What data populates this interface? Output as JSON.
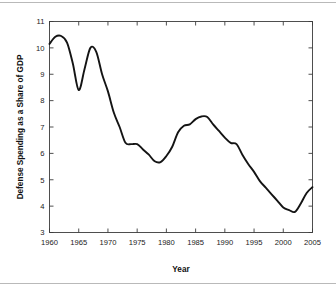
{
  "figure": {
    "background_color": "#ffffff",
    "border_color": "#b9b9b9",
    "line_color": "#141414",
    "axis_color": "#3c3c3c"
  },
  "chart_data": {
    "type": "line",
    "title": "",
    "xlabel": "Year",
    "ylabel": "Defense Spending as a Share of GDP",
    "xlim": [
      1960,
      2005
    ],
    "ylim": [
      3,
      11
    ],
    "xticks": [
      1960,
      1965,
      1970,
      1975,
      1980,
      1985,
      1990,
      1995,
      2000,
      2005
    ],
    "xticklabels": [
      "1960",
      "1965",
      "1970",
      "1975",
      "1980",
      "1985",
      "1990",
      "1995",
      "2000",
      "2005"
    ],
    "yticks": [
      3,
      4,
      5,
      6,
      7,
      8,
      9,
      10,
      11
    ],
    "yticklabels": [
      "3",
      "4",
      "5",
      "6",
      "7",
      "8",
      "9",
      "10",
      "11"
    ],
    "grid": false,
    "legend": null,
    "ticks_all_sides": true,
    "series": [
      {
        "name": "Defense Spending as a Share of GDP",
        "color": "#141414",
        "x": [
          1960,
          1961,
          1962,
          1963,
          1964,
          1965,
          1966,
          1967,
          1968,
          1969,
          1970,
          1971,
          1972,
          1973,
          1974,
          1975,
          1976,
          1977,
          1978,
          1979,
          1980,
          1981,
          1982,
          1983,
          1984,
          1985,
          1986,
          1987,
          1988,
          1989,
          1990,
          1991,
          1992,
          1993,
          1994,
          1995,
          1996,
          1997,
          1998,
          1999,
          2000,
          2001,
          2002,
          2003,
          2004,
          2005
        ],
        "values": [
          10.15,
          10.42,
          10.45,
          10.2,
          9.4,
          8.4,
          9.2,
          10.0,
          9.85,
          9.0,
          8.35,
          7.55,
          7.0,
          6.4,
          6.35,
          6.35,
          6.15,
          5.95,
          5.7,
          5.67,
          5.9,
          6.25,
          6.8,
          7.05,
          7.1,
          7.3,
          7.4,
          7.38,
          7.1,
          6.85,
          6.6,
          6.4,
          6.35,
          5.95,
          5.6,
          5.3,
          4.95,
          4.7,
          4.45,
          4.2,
          3.95,
          3.85,
          3.78,
          4.1,
          4.5,
          4.72
        ]
      }
    ]
  }
}
